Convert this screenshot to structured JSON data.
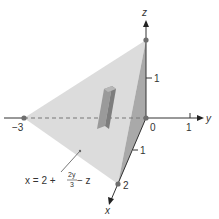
{
  "diagram": {
    "type": "3d-tetrahedron-region",
    "axes": {
      "x": {
        "label": "x",
        "ticks": [
          "1",
          "2"
        ]
      },
      "y": {
        "label": "y",
        "ticks": [
          "-3",
          "0",
          "1"
        ]
      },
      "z": {
        "label": "z",
        "ticks": [
          "1"
        ]
      }
    },
    "labels": {
      "x_axis": "x",
      "y_axis": "y",
      "z_axis": "z",
      "origin": "0",
      "y_neg3": "−3",
      "y_one": "1",
      "z_one": "1",
      "x_one": "1",
      "x_two": "2"
    },
    "equation": {
      "lhs": "x = 2 +",
      "frac_num": "2y",
      "frac_den": "3",
      "rhs": "− z"
    },
    "vertices": [
      {
        "name": "y = -3",
        "coords": [
          0,
          -3,
          0
        ]
      },
      {
        "name": "origin",
        "coords": [
          0,
          0,
          0
        ]
      },
      {
        "name": "z = 2",
        "coords": [
          0,
          0,
          2
        ]
      },
      {
        "name": "x = 2",
        "coords": [
          2,
          0,
          0
        ]
      }
    ],
    "colors": {
      "face_light": "#d9d9d9",
      "face_dark": "#a8a8a8",
      "axis": "#333333",
      "point": "#6e6e6e",
      "box": "#8c8c8c"
    }
  }
}
